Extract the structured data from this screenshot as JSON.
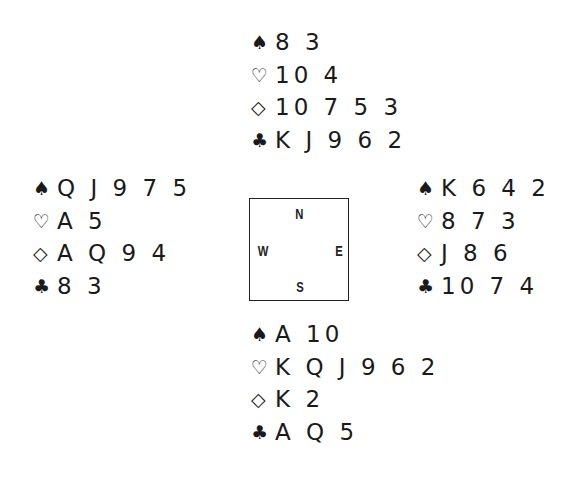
{
  "colors": {
    "text": "#1a1a1a",
    "border": "#222222",
    "background": "#ffffff"
  },
  "suit_symbols": {
    "spades": "♠",
    "hearts": "♡",
    "diamonds": "◇",
    "clubs": "♣"
  },
  "hands": {
    "north": {
      "spades": "8 3",
      "hearts": "10 4",
      "diamonds": "10 7 5 3",
      "clubs": "K J 9 6 2"
    },
    "west": {
      "spades": "Q J 9 7 5",
      "hearts": "A 5",
      "diamonds": "A Q 9 4",
      "clubs": "8 3"
    },
    "east": {
      "spades": "K 6 4 2",
      "hearts": "8 7 3",
      "diamonds": "J 8 6",
      "clubs": "10 7 4"
    },
    "south": {
      "spades": "A 10",
      "hearts": "K Q J 9 6 2",
      "diamonds": "K 2",
      "clubs": "A Q 5"
    }
  },
  "compass": {
    "north": "N",
    "west": "W",
    "east": "E",
    "south": "S"
  }
}
